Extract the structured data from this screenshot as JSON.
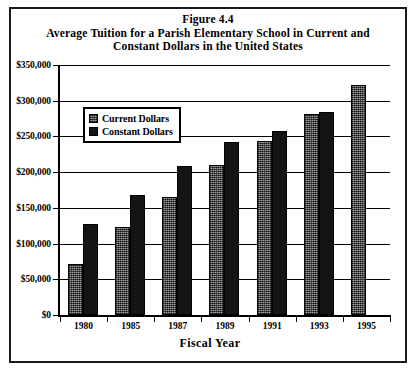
{
  "figure": {
    "number": "Figure 4.4",
    "title_line_1": "Average Tuition for a Parish Elementary School in Current and",
    "title_line_2": "Constant Dollars in the United States"
  },
  "legend": {
    "position": "inside-top-left",
    "items": [
      {
        "label": "Current Dollars",
        "swatch": "hatched-gray"
      },
      {
        "label": "Constant Dollars",
        "swatch": "solid-black"
      }
    ]
  },
  "axes": {
    "x_title": "Fiscal Year",
    "y_ticks": [
      "$0",
      "$50,000",
      "$100,000",
      "$150,000",
      "$200,000",
      "$250,000",
      "$300,000",
      "$350,000"
    ]
  },
  "chart_data": {
    "type": "bar",
    "title": "Average Tuition for a Parish Elementary School in Current and Constant Dollars in the United States",
    "subtitle": "Figure 4.4",
    "xlabel": "Fiscal Year",
    "ylabel": "",
    "ylim": [
      0,
      350000
    ],
    "ytick_step": 50000,
    "grid": true,
    "legend_position": "upper left (inside plot)",
    "categories": [
      "1980",
      "1985",
      "1987",
      "1989",
      "1991",
      "1993",
      "1995"
    ],
    "series": [
      {
        "name": "Current Dollars",
        "values": [
          72000,
          123000,
          165000,
          210000,
          243000,
          281000,
          322000
        ]
      },
      {
        "name": "Constant Dollars",
        "values": [
          128000,
          168000,
          208000,
          242000,
          258000,
          284000,
          null
        ]
      }
    ]
  },
  "colors": {
    "current_dollars": "#6e6e6e",
    "constant_dollars": "#141414",
    "axis": "#000000",
    "background": "#ffffff"
  }
}
